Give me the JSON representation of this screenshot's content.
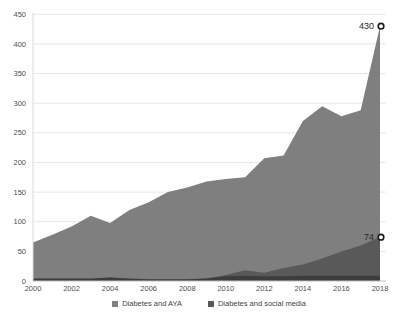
{
  "chart_data": {
    "type": "area",
    "title": "",
    "xlabel": "",
    "ylabel": "",
    "x": [
      2000,
      2001,
      2002,
      2003,
      2004,
      2005,
      2006,
      2007,
      2008,
      2009,
      2010,
      2011,
      2012,
      2013,
      2014,
      2015,
      2016,
      2017,
      2018
    ],
    "x_tick_labels": [
      "2000",
      "2002",
      "2004",
      "2006",
      "2008",
      "2010",
      "2012",
      "2014",
      "2016",
      "2018"
    ],
    "y_ticks": [
      0,
      50,
      100,
      150,
      200,
      250,
      300,
      350,
      400,
      450
    ],
    "ylim": [
      0,
      450
    ],
    "grid": "horizontal",
    "legend_position": "bottom",
    "series": [
      {
        "name": "Diabetes and AYA",
        "color": "#7f7f7f",
        "end_label": "430",
        "end_value": 430,
        "values": [
          65,
          78,
          92,
          110,
          98,
          120,
          133,
          150,
          158,
          168,
          172,
          175,
          207,
          212,
          270,
          295,
          278,
          288,
          430
        ]
      },
      {
        "name": "Diabetes and social media",
        "color": "#595959",
        "end_label": "74",
        "end_value": 74,
        "values": [
          2,
          2,
          2,
          3,
          6,
          3,
          2,
          2,
          2,
          4,
          10,
          18,
          14,
          22,
          28,
          38,
          50,
          60,
          74
        ]
      }
    ],
    "bottom_band": {
      "color": "#3d3d3d",
      "values": [
        4,
        4,
        4,
        4,
        6,
        4,
        3,
        3,
        3,
        4,
        8,
        9,
        8,
        8,
        9,
        9,
        9,
        9,
        9
      ]
    },
    "marker": "open-circle",
    "colors": {
      "gridline": "#e6e6e6",
      "axis_line": "#bfbfbf",
      "y_axis_line": "#d9d9d9",
      "tick_text": "#4d4d4d",
      "data_label_text": "#262626",
      "marker_stroke": "#1a1a1a",
      "marker_fill": "#ffffff",
      "background": "#ffffff"
    }
  }
}
